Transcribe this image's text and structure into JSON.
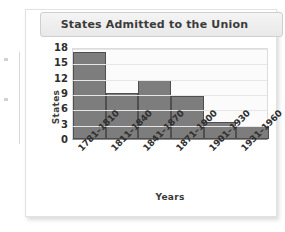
{
  "card": {
    "title": "States Admitted to the Union"
  },
  "chart_data": {
    "type": "bar",
    "title": "States Admitted to the Union",
    "xlabel": "Years",
    "ylabel": "States",
    "categories": [
      "1781–1810",
      "1811–1840",
      "1841–1870",
      "1871–1900",
      "1901–1930",
      "1931–1960"
    ],
    "values": [
      17,
      9,
      11.5,
      8.5,
      3.3,
      2.5
    ],
    "yticks": [
      18,
      15,
      12,
      9,
      6,
      3,
      0
    ],
    "ylim": [
      0,
      18
    ],
    "grid": true,
    "legend": "none",
    "bar_color": "#7d7d7d",
    "bar_border_color": "#4f4f4f",
    "plot_background": "#fbfbfb",
    "gridline_color": "#e6e6e6",
    "text_color": "#2f2f2f"
  }
}
